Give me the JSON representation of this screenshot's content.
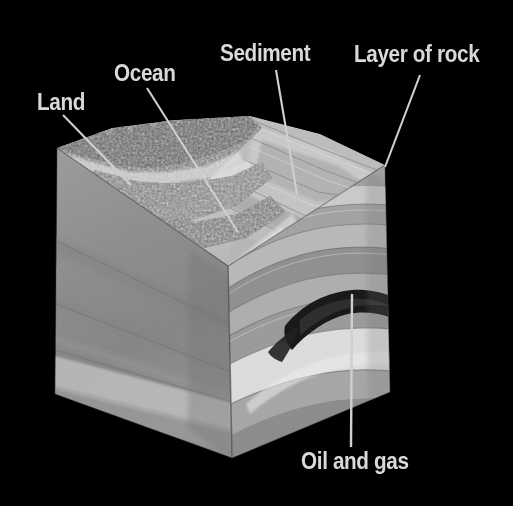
{
  "figure": {
    "background_color": "#000000",
    "label_color": "#d9d9d9",
    "leader_line_color": "#cfcfcf",
    "width": 513,
    "height": 506
  },
  "labels": [
    {
      "id": "land",
      "text": "Land",
      "x": 37,
      "y": 91,
      "leader": {
        "x1": 63,
        "y1": 115,
        "x2": 131,
        "y2": 185
      }
    },
    {
      "id": "ocean",
      "text": "Ocean",
      "x": 114,
      "y": 62,
      "leader": {
        "x1": 147,
        "y1": 88,
        "x2": 238,
        "y2": 232
      }
    },
    {
      "id": "sediment",
      "text": "Sediment",
      "x": 220,
      "y": 42,
      "leader": {
        "x1": 276,
        "y1": 70,
        "x2": 297,
        "y2": 194
      }
    },
    {
      "id": "layer-of-rock",
      "text": "Layer of rock",
      "x": 354,
      "y": 43,
      "leader": {
        "x1": 420,
        "y1": 75,
        "x2": 385,
        "y2": 167
      }
    },
    {
      "id": "oil-and-gas",
      "text": "Oil and gas",
      "x": 301,
      "y": 450,
      "leader": {
        "x1": 351,
        "y1": 447,
        "x2": 352,
        "y2": 294
      }
    }
  ],
  "block": {
    "name": "crustal-block",
    "faces": [
      {
        "name": "top-surface",
        "description": "rocky mountainous land and ocean floor with sediment bands"
      },
      {
        "name": "left-face",
        "description": "smooth gray cut face with faint horizontal strata",
        "base_color": "#8a8a8a"
      },
      {
        "name": "right-face",
        "description": "folded anticline strata with dark oil and gas pocket",
        "base_color": "#9a9a9a"
      }
    ],
    "geometry": {
      "top_left_corner": [
        57,
        148
      ],
      "top_back_corner": [
        250,
        118
      ],
      "top_right_corner": [
        385,
        165
      ],
      "front_top_corner": [
        228,
        266
      ],
      "left_bottom_corner": [
        55,
        394
      ],
      "front_bottom_corner": [
        232,
        458
      ],
      "right_bottom_corner": [
        390,
        392
      ]
    },
    "strata_right_face": [
      {
        "name": "band-1",
        "color": "#c8c8c8"
      },
      {
        "name": "band-2",
        "color": "#a4a4a4"
      },
      {
        "name": "band-3",
        "color": "#8e8e8e"
      },
      {
        "name": "band-4",
        "color": "#b8b8b8"
      },
      {
        "name": "band-5",
        "color": "#9c9c9c"
      },
      {
        "name": "oil-pocket",
        "color": "#151515"
      },
      {
        "name": "reservoir-cap",
        "color": "#dcdcdc"
      },
      {
        "name": "band-6",
        "color": "#7e7e7e"
      }
    ]
  }
}
